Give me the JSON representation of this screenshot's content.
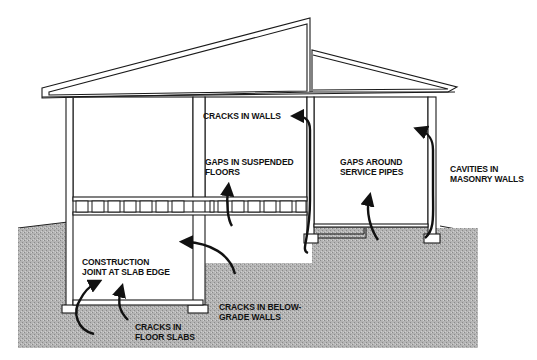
{
  "diagram": {
    "colors": {
      "ground": "#a9a9a9",
      "outline": "#1a1a1a",
      "arrow": "#111111",
      "background": "#ffffff"
    },
    "labels": {
      "cracks_in_walls": "CRACKS IN WALLS",
      "gaps_suspended_floors": "GAPS IN SUSPENDED\nFLOORS",
      "gaps_service_pipes": "GAPS AROUND\nSERVICE PIPES",
      "cavities_masonry": "CAVITIES IN\nMASONRY WALLS",
      "construction_joint": "CONSTRUCTION\nJOINT AT SLAB EDGE",
      "cracks_floor_slabs": "CRACKS IN\nFLOOR SLABS",
      "cracks_below_grade": "CRACKS IN BELOW-\nGRADE WALLS"
    }
  }
}
